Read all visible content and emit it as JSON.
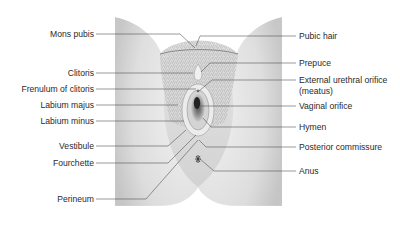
{
  "diagram": {
    "type": "anatomical-illustration",
    "left_labels": [
      {
        "id": "mons-pubis",
        "text": "Mons pubis",
        "y": 34
      },
      {
        "id": "clitoris",
        "text": "Clitoris",
        "y": 73
      },
      {
        "id": "frenulum-of-clitoris",
        "text": "Frenulum of clitoris",
        "y": 89
      },
      {
        "id": "labium-majus",
        "text": "Labium majus",
        "y": 105
      },
      {
        "id": "labium-minus",
        "text": "Labium minus",
        "y": 121
      },
      {
        "id": "vestibule",
        "text": "Vestibule",
        "y": 146
      },
      {
        "id": "fourchette",
        "text": "Fourchette",
        "y": 163
      },
      {
        "id": "perineum",
        "text": "Perineum",
        "y": 199
      }
    ],
    "right_labels": [
      {
        "id": "pubic-hair",
        "text": "Pubic hair",
        "y": 36
      },
      {
        "id": "prepuce",
        "text": "Prepuce",
        "y": 63
      },
      {
        "id": "external-urethral-orifice",
        "text": "External urethral orifice",
        "y": 80
      },
      {
        "id": "external-urethral-orifice-sub",
        "text": "(meatus)",
        "y": 90
      },
      {
        "id": "vaginal-orifice",
        "text": "Vaginal orifice",
        "y": 106
      },
      {
        "id": "hymen",
        "text": "Hymen",
        "y": 127
      },
      {
        "id": "posterior-commissure",
        "text": "Posterior commissure",
        "y": 147
      },
      {
        "id": "anus",
        "text": "Anus",
        "y": 171
      }
    ]
  },
  "colors": {
    "skin_light": "#f2f2f2",
    "skin_mid": "#d6d6d6",
    "skin_dark": "#a8a8a8",
    "leader_line": "#555555",
    "text": "#2a2a2a"
  }
}
